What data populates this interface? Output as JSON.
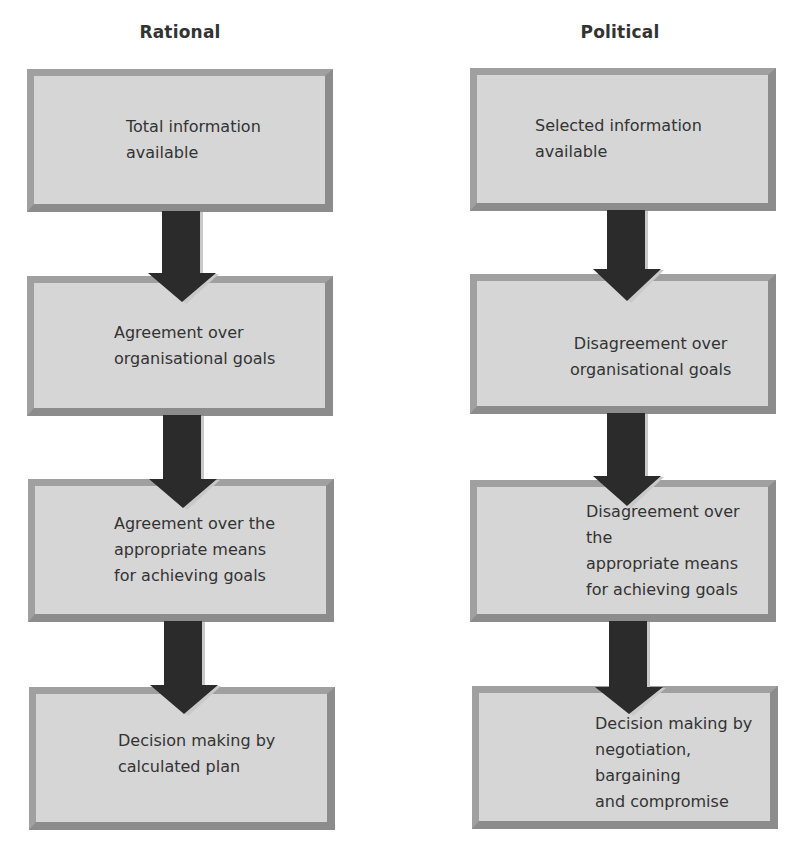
{
  "columns": [
    {
      "title": "Rational",
      "steps": [
        {
          "text": "Total information\navailable"
        },
        {
          "text": "Agreement over\norganisational goals"
        },
        {
          "text": "Agreement over the\nappropriate means\nfor achieving goals"
        },
        {
          "text": "Decision making by\ncalculated plan"
        }
      ]
    },
    {
      "title": "Political",
      "steps": [
        {
          "text": "Selected information\navailable"
        },
        {
          "text": "Disagreement over\norganisational goals"
        },
        {
          "text": "Disagreement over the\nappropriate means\nfor achieving goals"
        },
        {
          "text": "Decision making by\nnegotiation, bargaining\nand compromise"
        }
      ]
    }
  ],
  "colors": {
    "box_fill": "#d6d6d6",
    "box_border_light": "#a0a0a0",
    "box_border_dark": "#8c8c8c",
    "arrow": "#2b2b2b"
  }
}
